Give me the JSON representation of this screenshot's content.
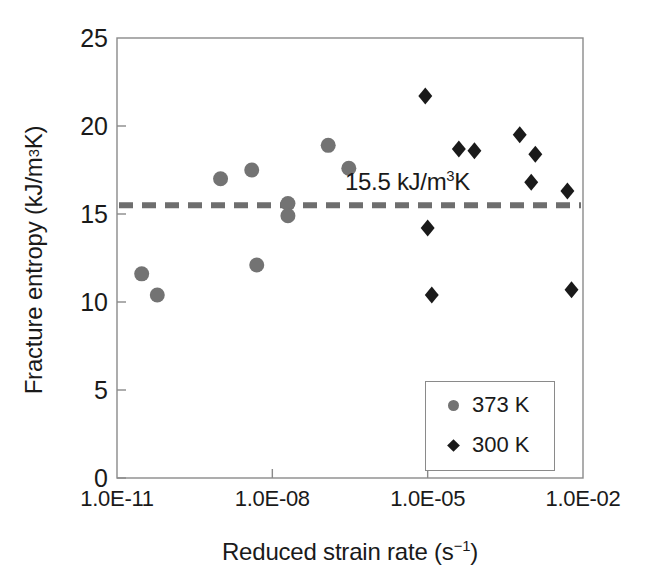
{
  "chart_data": {
    "type": "scatter",
    "title": "",
    "xlabel": "Reduced strain rate (s⁻¹)",
    "ylabel": "Fracture entropy (kJ/m³K)",
    "xscale": "log",
    "xlim": [
      1e-11,
      0.01
    ],
    "ylim": [
      0,
      25
    ],
    "xtick_labels": [
      "1.0E-11",
      "1.0E-08",
      "1.0E-05",
      "1.0E-02"
    ],
    "xtick_values": [
      1e-11,
      1e-08,
      1e-05,
      0.01
    ],
    "ytick_labels": [
      "0",
      "5",
      "10",
      "15",
      "20",
      "25"
    ],
    "ytick_values": [
      0,
      5,
      10,
      15,
      20,
      25
    ],
    "grid": false,
    "legend_position": "lower-right",
    "series": [
      {
        "name": "373 K",
        "marker": "circle",
        "color": "#737373",
        "points": [
          {
            "x": 3e-11,
            "y": 11.6
          },
          {
            "x": 6e-11,
            "y": 10.4
          },
          {
            "x": 1e-09,
            "y": 17.0
          },
          {
            "x": 4e-09,
            "y": 17.5
          },
          {
            "x": 5e-09,
            "y": 12.1
          },
          {
            "x": 2e-08,
            "y": 15.6
          },
          {
            "x": 2e-08,
            "y": 14.9
          },
          {
            "x": 1.2e-07,
            "y": 18.9
          },
          {
            "x": 3e-07,
            "y": 17.6
          }
        ]
      },
      {
        "name": "300 K",
        "marker": "diamond",
        "color": "#1a1a1a",
        "points": [
          {
            "x": 9e-06,
            "y": 21.7
          },
          {
            "x": 1e-05,
            "y": 14.2
          },
          {
            "x": 1.2e-05,
            "y": 10.4
          },
          {
            "x": 4e-05,
            "y": 18.7
          },
          {
            "x": 8e-05,
            "y": 18.6
          },
          {
            "x": 0.0006,
            "y": 19.5
          },
          {
            "x": 0.0012,
            "y": 18.4
          },
          {
            "x": 0.001,
            "y": 16.8
          },
          {
            "x": 0.005,
            "y": 16.3
          },
          {
            "x": 0.006,
            "y": 10.7
          }
        ]
      }
    ],
    "reference_line": {
      "value": 15.5,
      "label": "15.5 kJ/m³K",
      "style": "dashed",
      "color": "#6e6e6e"
    }
  },
  "axis": {
    "y_ticks": [
      {
        "label": "25",
        "value": 25
      },
      {
        "label": "20",
        "value": 20
      },
      {
        "label": "15",
        "value": 15
      },
      {
        "label": "10",
        "value": 10
      },
      {
        "label": "5",
        "value": 5
      },
      {
        "label": "0",
        "value": 0
      }
    ],
    "x_ticks": [
      {
        "label": "1.0E-11",
        "value": 1e-11
      },
      {
        "label": "1.0E-08",
        "value": 1e-08
      },
      {
        "label": "1.0E-05",
        "value": 1e-05
      },
      {
        "label": "1.0E-02",
        "value": 0.01
      }
    ]
  },
  "labels": {
    "y_axis_title_pre": "Fracture entropy (kJ/m",
    "y_axis_title_sup": "3",
    "y_axis_title_post": "K)",
    "x_axis_title_pre": "Reduced strain rate (s",
    "x_axis_title_sup": "−1",
    "x_axis_title_post": ")",
    "annotation_pre": "15.5 kJ/m",
    "annotation_sup": "3",
    "annotation_post": "K"
  },
  "legend": {
    "entries": [
      {
        "label": "373 K",
        "marker": "circle-icon",
        "color": "#737373"
      },
      {
        "label": "300 K",
        "marker": "diamond-icon",
        "color": "#1a1a1a"
      }
    ]
  },
  "colors": {
    "circle_series": "#737373",
    "diamond_series": "#1a1a1a",
    "reference_line": "#6e6e6e",
    "axis": "#8a8a8a",
    "background": "#ffffff"
  }
}
